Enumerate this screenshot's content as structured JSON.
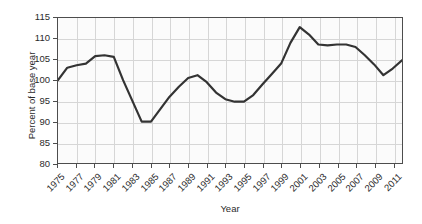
{
  "chart_data": {
    "type": "line",
    "title": "",
    "xlabel": "Year",
    "ylabel": "Percent of base year",
    "xlim": [
      1975,
      2012
    ],
    "ylim": [
      80,
      115
    ],
    "grid": true,
    "legend": false,
    "y_ticks": [
      80,
      85,
      90,
      95,
      100,
      105,
      110,
      115
    ],
    "x_ticks": [
      1975,
      1977,
      1979,
      1981,
      1983,
      1985,
      1987,
      1989,
      1991,
      1993,
      1995,
      1997,
      1999,
      2001,
      2003,
      2005,
      2007,
      2009,
      2011
    ],
    "x_tick_labels": [
      "1975",
      "1977",
      "1979",
      "1981",
      "1983",
      "1985",
      "1987",
      "1989",
      "1991",
      "1993",
      "1995",
      "1997",
      "1999",
      "2001",
      "2003",
      "2005",
      "2007",
      "2009",
      "2011"
    ],
    "line_color": "#333333",
    "line_width": 2.2,
    "series": [
      {
        "name": "Percent of base year",
        "x": [
          1975,
          1976,
          1977,
          1978,
          1979,
          1980,
          1981,
          1982,
          1983,
          1984,
          1985,
          1986,
          1987,
          1988,
          1989,
          1990,
          1991,
          1992,
          1993,
          1994,
          1995,
          1996,
          1997,
          1998,
          1999,
          2000,
          2001,
          2002,
          2003,
          2004,
          2005,
          2006,
          2007,
          2008,
          2009,
          2010,
          2011,
          2012
        ],
        "y": [
          100.0,
          103.0,
          103.6,
          104.0,
          105.8,
          106.0,
          105.6,
          100.0,
          95.0,
          90.0,
          90.0,
          93.0,
          96.0,
          98.4,
          100.5,
          101.2,
          99.5,
          97.0,
          95.4,
          94.8,
          94.8,
          96.4,
          99.0,
          101.5,
          104.0,
          109.0,
          112.8,
          111.0,
          108.6,
          108.4,
          108.6,
          108.6,
          108.0,
          106.0,
          103.8,
          101.2,
          102.8,
          104.8
        ]
      }
    ]
  }
}
